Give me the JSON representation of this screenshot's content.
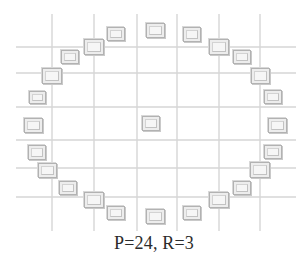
{
  "caption": "P=24, R=3",
  "chart_data": {
    "type": "scatter",
    "title": "P=24, R=3",
    "subtitle": "",
    "xlabel": "",
    "ylabel": "",
    "grid": true,
    "legend": null,
    "xlim": [
      0,
      308
    ],
    "ylim": [
      0,
      232
    ],
    "parameters": {
      "P": 24,
      "R": 3
    },
    "grid_lines": {
      "vertical_x": [
        52,
        94,
        137,
        177,
        219,
        260
      ],
      "horizontal_y": [
        47,
        73,
        107,
        140,
        168,
        197
      ],
      "color": "#d6d6d6",
      "width": 1.4
    },
    "center_point": {
      "index": 0,
      "label": "center",
      "x": 151,
      "y": 123,
      "w": 18,
      "h": 15
    },
    "neighbor_points": [
      {
        "index": 1,
        "angle_deg": 0,
        "x": 277,
        "y": 125,
        "w": 19,
        "h": 15
      },
      {
        "index": 2,
        "angle_deg": 15,
        "x": 273,
        "y": 97,
        "w": 18,
        "h": 14
      },
      {
        "index": 3,
        "angle_deg": 30,
        "x": 260,
        "y": 76,
        "w": 19,
        "h": 16
      },
      {
        "index": 4,
        "angle_deg": 45,
        "x": 242,
        "y": 57,
        "w": 18,
        "h": 14
      },
      {
        "index": 5,
        "angle_deg": 60,
        "x": 219,
        "y": 47,
        "w": 20,
        "h": 16
      },
      {
        "index": 6,
        "angle_deg": 75,
        "x": 192,
        "y": 34,
        "w": 18,
        "h": 15
      },
      {
        "index": 7,
        "angle_deg": 90,
        "x": 155,
        "y": 30,
        "w": 19,
        "h": 15
      },
      {
        "index": 8,
        "angle_deg": 105,
        "x": 116,
        "y": 34,
        "w": 18,
        "h": 14
      },
      {
        "index": 9,
        "angle_deg": 120,
        "x": 94,
        "y": 47,
        "w": 20,
        "h": 16
      },
      {
        "index": 10,
        "angle_deg": 135,
        "x": 70,
        "y": 57,
        "w": 18,
        "h": 14
      },
      {
        "index": 11,
        "angle_deg": 150,
        "x": 52,
        "y": 76,
        "w": 20,
        "h": 16
      },
      {
        "index": 12,
        "angle_deg": 165,
        "x": 37,
        "y": 97,
        "w": 17,
        "h": 13
      },
      {
        "index": 13,
        "angle_deg": 180,
        "x": 33,
        "y": 125,
        "w": 19,
        "h": 15
      },
      {
        "index": 14,
        "angle_deg": 195,
        "x": 37,
        "y": 152,
        "w": 18,
        "h": 15
      },
      {
        "index": 15,
        "angle_deg": 210,
        "x": 47,
        "y": 170,
        "w": 19,
        "h": 15
      },
      {
        "index": 16,
        "angle_deg": 225,
        "x": 68,
        "y": 188,
        "w": 18,
        "h": 14
      },
      {
        "index": 17,
        "angle_deg": 240,
        "x": 94,
        "y": 200,
        "w": 20,
        "h": 16
      },
      {
        "index": 18,
        "angle_deg": 255,
        "x": 116,
        "y": 213,
        "w": 18,
        "h": 14
      },
      {
        "index": 19,
        "angle_deg": 270,
        "x": 155,
        "y": 216,
        "w": 19,
        "h": 15
      },
      {
        "index": 20,
        "angle_deg": 285,
        "x": 192,
        "y": 213,
        "w": 18,
        "h": 14
      },
      {
        "index": 21,
        "angle_deg": 300,
        "x": 219,
        "y": 200,
        "w": 20,
        "h": 16
      },
      {
        "index": 22,
        "angle_deg": 315,
        "x": 242,
        "y": 188,
        "w": 18,
        "h": 14
      },
      {
        "index": 23,
        "angle_deg": 330,
        "x": 260,
        "y": 170,
        "w": 20,
        "h": 16
      },
      {
        "index": 24,
        "angle_deg": 345,
        "x": 273,
        "y": 152,
        "w": 18,
        "h": 14
      }
    ],
    "colors": {
      "marker_fill": "#ededed",
      "marker_edge": "#b2b2b2",
      "marker_inner": "#f6f6f6",
      "grid": "#d6d6d6",
      "background": "#ffffff",
      "caption_text": "#2b2b2b"
    }
  }
}
